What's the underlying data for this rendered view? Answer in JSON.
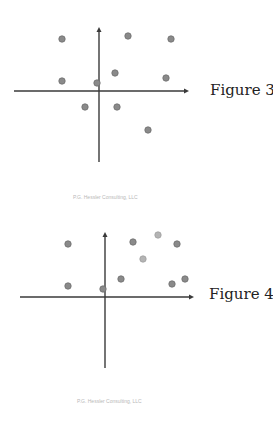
{
  "chart_data": [
    {
      "type": "scatter",
      "title": "Figure 3",
      "xlabel": "",
      "ylabel": "",
      "grid": false,
      "axes": {
        "origin_px": [
          99,
          91
        ],
        "x_axis_px": [
          14,
          189
        ],
        "y_axis_px": [
          27,
          162
        ]
      },
      "points_px": [
        {
          "x": 62,
          "y": 39,
          "shade": "dark"
        },
        {
          "x": 128,
          "y": 36,
          "shade": "dark"
        },
        {
          "x": 171,
          "y": 39,
          "shade": "dark"
        },
        {
          "x": 62,
          "y": 81,
          "shade": "dark"
        },
        {
          "x": 97,
          "y": 83,
          "shade": "dark"
        },
        {
          "x": 115,
          "y": 73,
          "shade": "dark"
        },
        {
          "x": 166,
          "y": 78,
          "shade": "dark"
        },
        {
          "x": 85,
          "y": 107,
          "shade": "dark"
        },
        {
          "x": 117,
          "y": 107,
          "shade": "dark"
        },
        {
          "x": 148,
          "y": 130,
          "shade": "dark"
        }
      ],
      "points": [
        {
          "x": -3.7,
          "y": 5.2
        },
        {
          "x": 2.9,
          "y": 5.5
        },
        {
          "x": 7.2,
          "y": 5.2
        },
        {
          "x": -3.7,
          "y": 1.0
        },
        {
          "x": -0.2,
          "y": 0.8
        },
        {
          "x": 1.6,
          "y": 1.8
        },
        {
          "x": 6.7,
          "y": 1.3
        },
        {
          "x": -1.4,
          "y": -1.6
        },
        {
          "x": 1.8,
          "y": -1.6
        },
        {
          "x": 4.9,
          "y": -3.9
        }
      ],
      "label": "Figure 3",
      "footer": "P.G. Hessler Consulting, LLC"
    },
    {
      "type": "scatter",
      "title": "Figure 4",
      "xlabel": "",
      "ylabel": "",
      "grid": false,
      "axes": {
        "origin_px": [
          105,
          87
        ],
        "x_axis_px": [
          20,
          194
        ],
        "y_axis_px": [
          22,
          158
        ]
      },
      "points_px": [
        {
          "x": 68,
          "y": 34,
          "shade": "dark"
        },
        {
          "x": 133,
          "y": 32,
          "shade": "dark"
        },
        {
          "x": 158,
          "y": 25,
          "shade": "light"
        },
        {
          "x": 177,
          "y": 34,
          "shade": "dark"
        },
        {
          "x": 143,
          "y": 49,
          "shade": "light"
        },
        {
          "x": 68,
          "y": 76,
          "shade": "dark"
        },
        {
          "x": 103,
          "y": 79,
          "shade": "dark"
        },
        {
          "x": 121,
          "y": 69,
          "shade": "dark"
        },
        {
          "x": 172,
          "y": 74,
          "shade": "dark"
        },
        {
          "x": 185,
          "y": 69,
          "shade": "dark"
        }
      ],
      "points": [
        {
          "x": -3.7,
          "y": 5.3
        },
        {
          "x": 2.8,
          "y": 5.5
        },
        {
          "x": 5.3,
          "y": 6.2
        },
        {
          "x": 7.2,
          "y": 5.3
        },
        {
          "x": 3.8,
          "y": 3.8
        },
        {
          "x": -3.7,
          "y": 1.1
        },
        {
          "x": -0.2,
          "y": 0.8
        },
        {
          "x": 1.6,
          "y": 1.8
        },
        {
          "x": 6.7,
          "y": 1.3
        },
        {
          "x": 8.0,
          "y": 1.8
        }
      ],
      "label": "Figure 4",
      "footer": "P.G. Hessler Consulting, LLC"
    }
  ],
  "colors": {
    "axis": "#3a3a3a",
    "point_dark": "#8a8a8a",
    "point_dark_stroke": "#6e6e6e",
    "point_light": "#b4b4b4",
    "point_light_stroke": "#a0a0a0",
    "footer": "#b8b8b8"
  }
}
